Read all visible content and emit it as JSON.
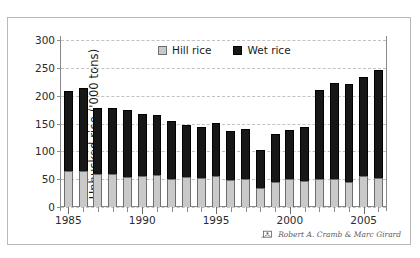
{
  "chart_data": {
    "type": "bar",
    "stacked": true,
    "title": "",
    "xlabel": "",
    "ylabel": "Unhusked rice ('000 tons)",
    "ylim": [
      0,
      300
    ],
    "yticks": [
      0,
      50,
      100,
      150,
      200,
      250,
      300
    ],
    "xtick_labels": [
      "1985",
      "1990",
      "1995",
      "2000",
      "2005"
    ],
    "grid": "horizontal-dashed",
    "legend_position": "top-center",
    "categories": [
      "1985",
      "1986",
      "1987",
      "1988",
      "1989",
      "1990",
      "1991",
      "1992",
      "1993",
      "1994",
      "1995",
      "1996",
      "1997",
      "1998",
      "1999",
      "2000",
      "2001",
      "2002",
      "2003",
      "2004",
      "2005",
      "2006"
    ],
    "series": [
      {
        "name": "Hill rice",
        "color": "#c9c9c9",
        "values": [
          64,
          65,
          59,
          60,
          54,
          55,
          57,
          51,
          54,
          52,
          56,
          49,
          50,
          34,
          45,
          51,
          47,
          50,
          51,
          45,
          55,
          53
        ]
      },
      {
        "name": "Wet rice",
        "color": "#171717",
        "values": [
          145,
          149,
          119,
          118,
          120,
          112,
          109,
          103,
          94,
          92,
          95,
          87,
          90,
          68,
          86,
          88,
          96,
          161,
          172,
          176,
          179,
          194
        ]
      }
    ],
    "totals": [
      209,
      214,
      178,
      178,
      174,
      167,
      166,
      154,
      148,
      144,
      151,
      136,
      140,
      102,
      131,
      139,
      143,
      211,
      223,
      221,
      234,
      247
    ]
  },
  "legend": {
    "items": [
      {
        "label": "Hill rice",
        "swatch": "hill-rice-swatch"
      },
      {
        "label": "Wet rice",
        "swatch": "wet-rice-swatch"
      }
    ]
  },
  "attribution": {
    "text": "Robert A. Cramb & Marc Girard",
    "icon": "logo-icon"
  }
}
